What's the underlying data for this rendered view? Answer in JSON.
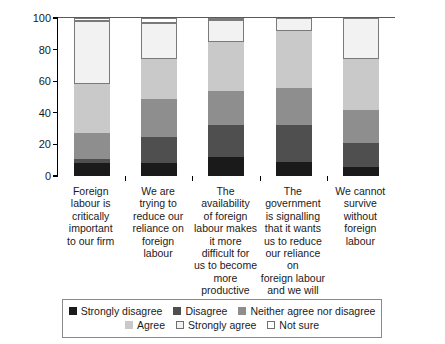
{
  "chart_data": {
    "type": "bar",
    "subtype": "stacked-bar-100",
    "title": "",
    "xlabel": "",
    "ylabel": "Percentage",
    "ylim": [
      0,
      100
    ],
    "yticks": [
      0,
      20,
      40,
      60,
      80,
      100
    ],
    "ytick_labels": [
      "0",
      "20",
      "40",
      "60",
      "80",
      "100"
    ],
    "grid": false,
    "legend_position": "bottom",
    "categories": [
      "Foreign labour is critically important to our firm",
      "We are trying to reduce our reliance on foreign labour",
      "The availability of foreign labour makes it more difficult for us to become more productive",
      "The government is signalling that it wants us to reduce our reliance on foreign labour and we will",
      "We cannot survive without foreign labour"
    ],
    "category_lines": [
      [
        "Foreign",
        "labour is",
        "critically",
        "important",
        "to our firm"
      ],
      [
        "We are",
        "trying to",
        "reduce our",
        "reliance on",
        "foreign",
        "labour"
      ],
      [
        "The availability",
        "of foreign",
        "labour makes",
        "it more",
        "difficult for",
        "us to become",
        "more",
        "productive"
      ],
      [
        "The",
        "government",
        "is signalling",
        "that it wants",
        "us to reduce",
        "our reliance on",
        "foreign labour",
        "and we will"
      ],
      [
        "We cannot",
        "survive",
        "without",
        "foreign",
        "labour"
      ]
    ],
    "series": [
      {
        "name": "Strongly disagree",
        "color": "#1a1a1a",
        "outlined": false,
        "values": [
          8,
          8,
          12,
          9,
          6
        ]
      },
      {
        "name": "Disagree",
        "color": "#4f4f4f",
        "outlined": false,
        "values": [
          3,
          17,
          20,
          23,
          15
        ]
      },
      {
        "name": "Neither agree nor disagree",
        "color": "#8e8e8e",
        "outlined": false,
        "values": [
          16,
          24,
          22,
          24,
          21
        ]
      },
      {
        "name": "Agree",
        "color": "#c9c9c9",
        "outlined": false,
        "values": [
          31,
          25,
          31,
          36,
          32
        ]
      },
      {
        "name": "Strongly agree",
        "color": "#f2f2f2",
        "outlined": true,
        "values": [
          40,
          23,
          14,
          8,
          26
        ]
      },
      {
        "name": "Not sure",
        "color": "#ffffff",
        "outlined": true,
        "values": [
          2,
          3,
          1,
          0,
          0
        ]
      }
    ]
  },
  "legend": {
    "rows": [
      [
        "Strongly disagree",
        "Disagree",
        "Neither agree nor disagree"
      ],
      [
        "Agree",
        "Strongly agree",
        "Not sure"
      ]
    ]
  }
}
